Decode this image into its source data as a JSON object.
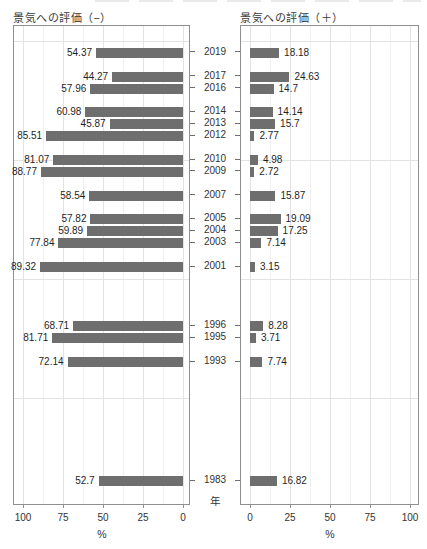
{
  "chart_data": {
    "type": "bar",
    "variant": "diverging-horizontal-bilateral",
    "panels": {
      "left": {
        "title": "景気への評価（−）",
        "direction": "right-to-left",
        "x_ticks": [
          100,
          75,
          50,
          25,
          0
        ]
      },
      "right": {
        "title": "景気への評価（＋）",
        "direction": "left-to-right",
        "x_ticks": [
          0,
          25,
          50,
          75,
          100
        ]
      }
    },
    "categories_years": [
      2019,
      2017,
      2016,
      2014,
      2013,
      2012,
      2010,
      2009,
      2007,
      2005,
      2004,
      2003,
      2001,
      1996,
      1995,
      1993,
      1983
    ],
    "series": [
      {
        "name": "景気への評価（−）",
        "panel": "left",
        "values": [
          54.37,
          44.27,
          57.96,
          60.98,
          45.87,
          85.51,
          81.07,
          88.77,
          58.54,
          57.82,
          59.89,
          77.84,
          89.32,
          68.71,
          81.71,
          72.14,
          52.7
        ],
        "labels": [
          "54.37",
          "44.27",
          "57.96",
          "60.98",
          "45.87",
          "85.51",
          "81.07",
          "88.77",
          "58.54",
          "57.82",
          "59.89",
          "77.84",
          "89.32",
          "68.71",
          "81.71",
          "72.14",
          "52.7"
        ]
      },
      {
        "name": "景気への評価（＋）",
        "panel": "right",
        "values": [
          18.18,
          24.63,
          14.7,
          14.14,
          15.7,
          2.77,
          4.98,
          2.72,
          15.87,
          19.09,
          17.25,
          7.14,
          3.15,
          8.28,
          3.71,
          7.74,
          16.82
        ],
        "labels": [
          "18.18",
          "24.63",
          "14.7",
          "14.14",
          "15.7",
          "2.77",
          "4.98",
          "2.72",
          "15.87",
          "19.09",
          "17.25",
          "7.14",
          "3.15",
          "8.28",
          "3.71",
          "7.74",
          "16.82"
        ]
      }
    ],
    "xlabel": "%",
    "ylabel": "年",
    "xlim": [
      0,
      100
    ],
    "x_minor_step": 12.5,
    "x_major_step": 25,
    "year_axis_range": [
      1980.9,
      2021.27
    ],
    "horizontal_grid_years": [
      2020,
      2010,
      2000,
      1990
    ],
    "grid": true,
    "legend_position": "none",
    "bar_color": "#6e6e6e",
    "grid_major_color": "#e3e3e3",
    "grid_minor_color": "#f0f0f0",
    "panel_border_color": "#8f8f8f"
  }
}
